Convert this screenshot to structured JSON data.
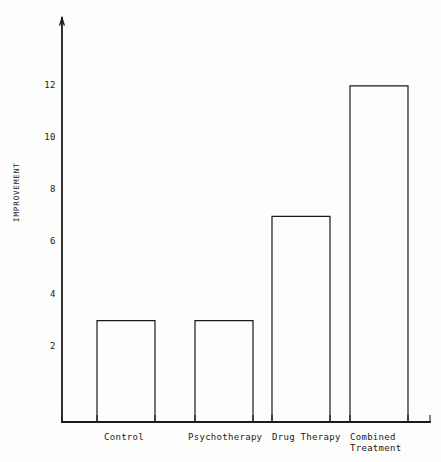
{
  "chart_data": {
    "type": "bar",
    "title": "",
    "subtitle": "",
    "xlabel": "",
    "ylabel": "IMPROVEMENT",
    "categories": [
      "Control",
      "Psychotherapy",
      "Drug Therapy",
      "Combined Treatment"
    ],
    "category_lines": [
      [
        "Control"
      ],
      [
        "Psychotherapy"
      ],
      [
        "Drug Therapy"
      ],
      [
        "Combined",
        "Treatment"
      ]
    ],
    "values": [
      3,
      3,
      7,
      12
    ],
    "ylim": [
      0,
      14
    ],
    "yticks": [
      2,
      4,
      6,
      8,
      10,
      12
    ],
    "ytick_labels": [
      "2",
      "4",
      "6",
      "8",
      "10",
      "12"
    ],
    "grid": false,
    "legend": null,
    "bar_style": {
      "fill": "none",
      "stroke": "#1a1a1a",
      "stroke_width": 1.2
    },
    "axis_style": {
      "stroke": "#1a1a1a",
      "y_axis_arrow": true,
      "x_axis_ticks": true
    },
    "background_color": "#fdfdfb",
    "text_color": "#1a1a1a"
  },
  "geometry": {
    "baseline_y": 422,
    "value_origin_y": 399,
    "px_per_unit": 26.1,
    "axis_x": 62,
    "axis_top_y": 18,
    "axis_right_x": 430,
    "bar_width": 58,
    "bar_lefts": [
      97,
      195,
      272,
      350
    ],
    "tick_xs": [
      62,
      97,
      155,
      195,
      253,
      272,
      330,
      350,
      408,
      430
    ],
    "cat_label_lefts": [
      104,
      188,
      272,
      350
    ]
  }
}
